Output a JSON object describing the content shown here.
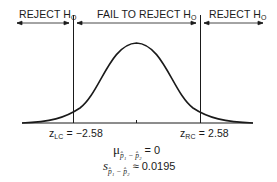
{
  "regions": {
    "left": {
      "label": "REJECT H",
      "sub": "O"
    },
    "center": {
      "label": "FAIL TO REJECT H",
      "sub": "O"
    },
    "right": {
      "label": "REJECT H",
      "sub": "O"
    }
  },
  "critical_values": {
    "left": {
      "symbol": "z",
      "sub": "LC",
      "value": "= −2.58"
    },
    "right": {
      "symbol": "z",
      "sub": "RC",
      "value": "= 2.58"
    }
  },
  "mean": {
    "symbol": "μ",
    "sub": "p̂₁ − p̂₂",
    "value": "= 0"
  },
  "std_error": {
    "symbol": "s",
    "sub": "p̂₁ − p̂₂",
    "value": "≈ 0.0195"
  },
  "colors": {
    "ink": "#1a1a1a",
    "background": "#ffffff"
  }
}
